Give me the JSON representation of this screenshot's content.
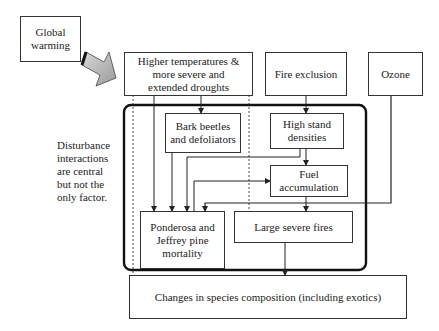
{
  "diagram": {
    "nodes": {
      "global_warming": "Global warming",
      "higher_temps": "Higher temperatures & more severe and extended droughts",
      "fire_exclusion": "Fire exclusion",
      "ozone": "Ozone",
      "bark_beetles": "Bark beetles and defoliators",
      "high_stand": "High stand densities",
      "fuel_accumulation": "Fuel accumulation",
      "pine_mortality": "Ponderosa and Jeffrey pine mortality",
      "large_fires": "Large severe fires",
      "species_change": "Changes in species composition (including exotics)"
    },
    "note": "Disturbance interactions are central but not the only factor.",
    "edges": [
      {
        "from": "Global warming",
        "to": "Higher temperatures & more severe and extended droughts",
        "style": "block-arrow"
      },
      {
        "from": "Higher temperatures & more severe and extended droughts",
        "to": "Bark beetles and defoliators"
      },
      {
        "from": "Higher temperatures & more severe and extended droughts",
        "to": "Ponderosa and Jeffrey pine mortality"
      },
      {
        "from": "Higher temperatures & more severe and extended droughts",
        "to": "Changes in species composition (including exotics)",
        "style": "dotted"
      },
      {
        "from": "Higher temperatures & more severe and extended droughts",
        "to": "Large severe fires",
        "style": "dotted"
      },
      {
        "from": "Fire exclusion",
        "to": "High stand densities"
      },
      {
        "from": "Ozone",
        "to": "Ponderosa and Jeffrey pine mortality"
      },
      {
        "from": "Bark beetles and defoliators",
        "to": "Ponderosa and Jeffrey pine mortality"
      },
      {
        "from": "High stand densities",
        "to": "Fuel accumulation"
      },
      {
        "from": "High stand densities",
        "to": "Ponderosa and Jeffrey pine mortality"
      },
      {
        "from": "Ponderosa and Jeffrey pine mortality",
        "to": "Fuel accumulation"
      },
      {
        "from": "Fuel accumulation",
        "to": "Large severe fires"
      },
      {
        "from": "Large severe fires",
        "to": "Changes in species composition (including exotics)"
      }
    ]
  },
  "lines": {
    "global_warming": [
      "Global",
      "warming"
    ],
    "higher_temps": [
      "Higher temperatures &",
      "more severe and",
      "extended droughts"
    ],
    "bark_beetles": [
      "Bark beetles",
      "and defoliators"
    ],
    "high_stand": [
      "High stand",
      "densities"
    ],
    "fuel_accumulation": [
      "Fuel",
      "accumulation"
    ],
    "pine_mortality": [
      "Ponderosa and",
      "Jeffrey pine",
      "mortality"
    ],
    "note": [
      "Disturbance",
      "interactions",
      "are central",
      "but not the",
      "only factor."
    ]
  }
}
